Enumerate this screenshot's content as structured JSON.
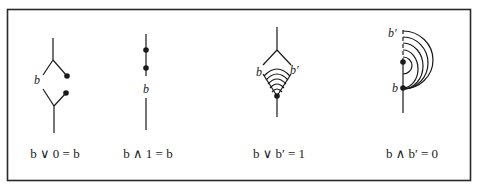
{
  "figure": {
    "border_color": "#2a2a2a",
    "stroke_color": "#1a1a1a",
    "diagrams": [
      {
        "id": "join-with-zero",
        "caption": "b ∨ 0 = b",
        "labels": {
          "b": "b"
        }
      },
      {
        "id": "meet-with-one",
        "caption": "b ∧ 1 = b",
        "labels": {
          "b": "b"
        }
      },
      {
        "id": "join-with-complement",
        "caption": "b ∨ b′ = 1",
        "labels": {
          "b": "b",
          "b_prime": "b′"
        }
      },
      {
        "id": "meet-with-complement",
        "caption": "b ∧ b′ = 0",
        "labels": {
          "b": "b",
          "b_prime": "b′"
        }
      }
    ]
  }
}
